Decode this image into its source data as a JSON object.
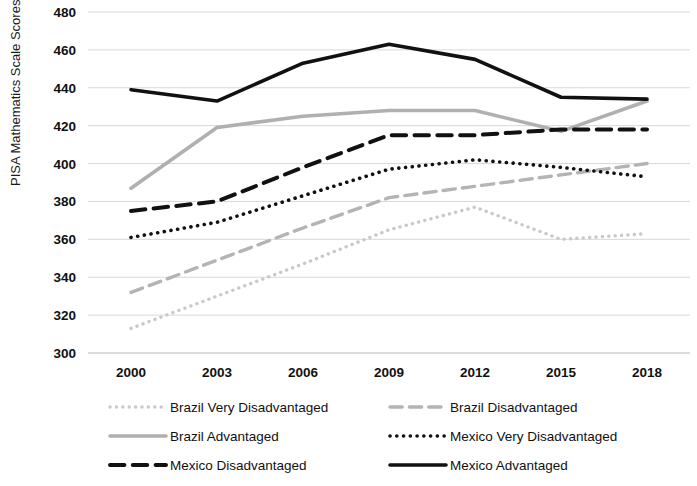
{
  "chart_data": {
    "type": "line",
    "title": "",
    "xlabel": "",
    "ylabel": "PISA Mathematics Scale Scores",
    "x": [
      2000,
      2003,
      2006,
      2009,
      2012,
      2015,
      2018
    ],
    "categories": [
      "2000",
      "2003",
      "2006",
      "2009",
      "2012",
      "2015",
      "2018"
    ],
    "ylim": [
      300,
      480
    ],
    "ytick_step": 20,
    "yticks": [
      300,
      320,
      340,
      360,
      380,
      400,
      420,
      440,
      460,
      480
    ],
    "ytick_labels": [
      "300",
      "320",
      "340",
      "360",
      "380",
      "400",
      "420",
      "440",
      "460",
      "480"
    ],
    "grid": true,
    "legend_position": "bottom",
    "series": [
      {
        "name": "Brazil Very Disadvantaged",
        "values": [
          313,
          330,
          347,
          365,
          377,
          360,
          363
        ],
        "color": "#c9c9c9",
        "style": "dotted",
        "width": 3.4
      },
      {
        "name": "Brazil Disadvantaged",
        "values": [
          332,
          349,
          366,
          382,
          388,
          394,
          400
        ],
        "color": "#b4b4b4",
        "style": "dashed",
        "width": 3.4
      },
      {
        "name": "Brazil Advantaged",
        "values": [
          387,
          419,
          425,
          428,
          428,
          417,
          433
        ],
        "color": "#b0b0b0",
        "style": "solid",
        "width": 3.6
      },
      {
        "name": "Mexico Very Disadvantaged",
        "values": [
          361,
          369,
          383,
          397,
          402,
          398,
          393
        ],
        "color": "#111111",
        "style": "dotted",
        "width": 3.6
      },
      {
        "name": "Mexico Disadvantaged",
        "values": [
          375,
          380,
          398,
          415,
          415,
          418,
          418
        ],
        "color": "#111111",
        "style": "dashed",
        "width": 4.0
      },
      {
        "name": "Mexico Advantaged",
        "values": [
          439,
          433,
          453,
          463,
          455,
          435,
          434
        ],
        "color": "#111111",
        "style": "solid",
        "width": 3.6
      }
    ]
  },
  "legend": {
    "items": [
      {
        "label": "Brazil Very Disadvantaged"
      },
      {
        "label": "Brazil Disadvantaged"
      },
      {
        "label": "Brazil Advantaged"
      },
      {
        "label": "Mexico Very Disadvantaged"
      },
      {
        "label": "Mexico Disadvantaged"
      },
      {
        "label": "Mexico Advantaged"
      }
    ]
  }
}
